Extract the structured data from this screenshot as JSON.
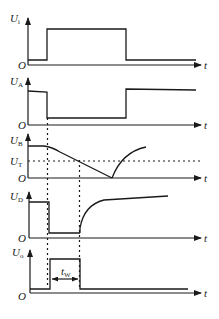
{
  "diagram": {
    "type": "timing-diagram",
    "axis_time_label": "t",
    "origin_label": "O",
    "colors": {
      "stroke": "#1a1a1a",
      "background": "#ffffff"
    },
    "panels": [
      {
        "id": "ui",
        "label": "U",
        "subscript": "i",
        "description": "input trigger pulse"
      },
      {
        "id": "ua",
        "label": "U",
        "subscript": "A",
        "description": "node A voltage"
      },
      {
        "id": "ub",
        "label": "U",
        "subscript": "B",
        "description": "node B (capacitor) voltage"
      },
      {
        "id": "ud",
        "label": "U",
        "subscript": "D",
        "description": "node D voltage"
      },
      {
        "id": "uo",
        "label": "U",
        "subscript": "o",
        "description": "output pulse"
      }
    ],
    "threshold": {
      "label": "U",
      "subscript": "T"
    },
    "pulse_width": {
      "label": "t",
      "subscript": "W"
    }
  }
}
